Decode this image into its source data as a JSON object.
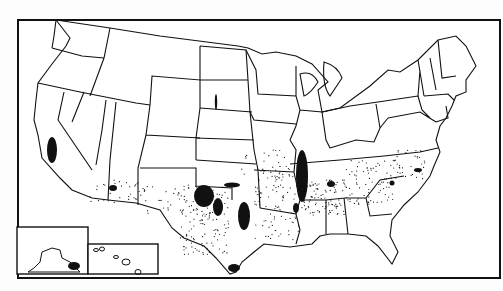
{
  "map": {
    "type": "dot-distribution map",
    "region": "United States (contiguous) with Alaska and Hawaii insets",
    "colors": {
      "background": "#ffffff",
      "ink": "#111111"
    },
    "frame": {
      "x": 18,
      "y": 22,
      "width": 485,
      "height": 258
    },
    "insets": [
      {
        "name": "Alaska",
        "x": 17,
        "y": 227,
        "width": 71,
        "height": 46
      },
      {
        "name": "Hawaii",
        "x": 88,
        "y": 244,
        "width": 70,
        "height": 30
      }
    ],
    "dense_clusters": [
      {
        "name": "California Central Valley",
        "cx": 52,
        "cy": 150,
        "rx": 6,
        "ry": 14
      },
      {
        "name": "Central Arizona",
        "cx": 113,
        "cy": 188,
        "rx": 4,
        "ry": 3
      },
      {
        "name": "Texas High Plains",
        "cx": 207,
        "cy": 198,
        "rx": 11,
        "ry": 13
      },
      {
        "name": "Texas Rolling Plains",
        "cx": 217,
        "cy": 207,
        "rx": 6,
        "ry": 9
      },
      {
        "name": "Central Texas Blacklands",
        "cx": 244,
        "cy": 215,
        "rx": 7,
        "ry": 14
      },
      {
        "name": "Oklahoma Panhandle",
        "cx": 232,
        "cy": 184,
        "rx": 8,
        "ry": 3
      },
      {
        "name": "Mississippi Delta",
        "cx": 302,
        "cy": 180,
        "rx": 7,
        "ry": 28
      },
      {
        "name": "Lower Rio Grande Valley",
        "cx": 234,
        "cy": 268,
        "rx": 6,
        "ry": 4
      },
      {
        "name": "Alabama North",
        "cx": 331,
        "cy": 184,
        "rx": 4,
        "ry": 3
      },
      {
        "name": "South Carolina",
        "cx": 392,
        "cy": 183,
        "rx": 3,
        "ry": 3
      },
      {
        "name": "North Carolina Coast",
        "cx": 418,
        "cy": 170,
        "rx": 4,
        "ry": 2
      }
    ]
  }
}
